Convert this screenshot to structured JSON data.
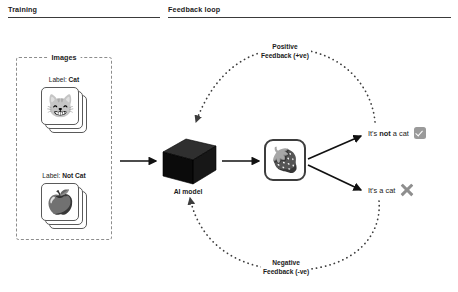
{
  "diagram": {
    "title_sections": [
      {
        "id": "training",
        "label": "Training"
      },
      {
        "id": "feedback-loop",
        "label": "Feedback loop"
      }
    ],
    "training": {
      "group_title": "Images",
      "cards": [
        {
          "id": "cat",
          "label_prefix": "Label: ",
          "label_value": "Cat",
          "glyph": "😸",
          "icon_name": "cat-face-emoji"
        },
        {
          "id": "not-cat",
          "label_prefix": "Label: ",
          "label_value": "Not Cat",
          "glyph": "🍎",
          "icon_name": "apple-emoji"
        }
      ]
    },
    "model": {
      "label": "AI model",
      "icon_name": "black-cube-icon"
    },
    "inference_input": {
      "glyph": "🍓",
      "icon_name": "strawberry-emoji"
    },
    "outcomes": [
      {
        "id": "not-a-cat",
        "text_before": "It's ",
        "text_emphasis": "not",
        "text_after": " a cat",
        "mark": "check",
        "mark_name": "check-mark-icon",
        "mark_color": "#9a9a9a"
      },
      {
        "id": "a-cat",
        "text_before": "It's a cat",
        "text_emphasis": "",
        "text_after": "",
        "mark": "cross",
        "mark_name": "cross-mark-icon",
        "mark_color": "#8e8e8e"
      }
    ],
    "feedback": [
      {
        "id": "positive",
        "line1": "Positive",
        "line2": "Feedback (+ve)"
      },
      {
        "id": "negative",
        "line1": "Negative",
        "line2": "Feedback (-ve)"
      }
    ],
    "colors": {
      "ink": "#1b1b1b",
      "rule": "#3a3a3a",
      "dashed_border": "#8d8d8d",
      "cube_front": "#0d0d0d",
      "cube_top": "#2b2b2b",
      "cube_side": "#1a1a1a",
      "arrow": "#111111",
      "dotted": "#4d4d4d",
      "background": "#ffffff"
    }
  }
}
